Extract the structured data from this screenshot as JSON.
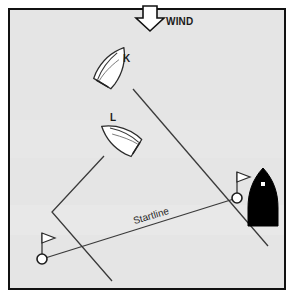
{
  "diagram": {
    "kind": "sailing-start-diagram",
    "colors": {
      "page_background": "#ffffff",
      "field_background": "#e7e7e7",
      "border": "#111111",
      "line": "#3a3a3a",
      "hull_white": "#ffffff",
      "hull_black": "#000000",
      "text": "#1a1a1a"
    },
    "frame": {
      "outer_margin_px": 8,
      "border_width_px": 2,
      "width_px": 294,
      "height_px": 298
    },
    "wind": {
      "label": "WIND",
      "direction": "down",
      "arrow_x": 150,
      "arrow_top_y": 6,
      "arrow_tip_y": 30,
      "label_x": 166,
      "label_y": 25
    },
    "boats": [
      {
        "id": "K",
        "label": "K",
        "fill": "white",
        "heading": "upper-left",
        "label_x": 123,
        "label_y": 62,
        "centre_x": 111,
        "centre_y": 69,
        "rotation_deg": 31
      },
      {
        "id": "L",
        "label": "L",
        "fill": "white",
        "heading": "upper-right",
        "label_x": 110,
        "label_y": 121,
        "centre_x": 122,
        "centre_y": 139,
        "rotation_deg": -58
      },
      {
        "id": "committee",
        "label": "",
        "fill": "black",
        "heading": "up",
        "centre_x": 263,
        "centre_y": 197,
        "rotation_deg": 0
      }
    ],
    "tracks": [
      {
        "name": "k-track",
        "of_boat": "K",
        "points": [
          [
            133,
            89
          ],
          [
            268,
            246
          ]
        ]
      },
      {
        "name": "l-track",
        "of_boat": "L",
        "points": [
          [
            104,
            156
          ],
          [
            52,
            212
          ],
          [
            112,
            281
          ]
        ]
      }
    ],
    "startline": {
      "label": "Startline",
      "from": [
        42,
        259
      ],
      "to": [
        237,
        198
      ],
      "label_x": 152,
      "label_y": 219,
      "label_rotation_deg": -17
    },
    "buoys": [
      {
        "name": "pin-end-buoy",
        "x": 42,
        "y": 259,
        "radius": 5,
        "flag_height": 26,
        "flag_side": "right"
      },
      {
        "name": "committee-end-buoy",
        "x": 237,
        "y": 198,
        "radius": 5,
        "flag_height": 26,
        "flag_side": "right"
      }
    ]
  }
}
